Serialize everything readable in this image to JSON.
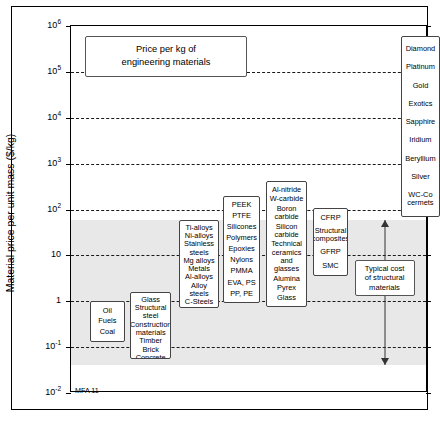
{
  "chart_data": {
    "type": "bar",
    "title_lines": [
      "Price per kg of",
      "engineering materials"
    ],
    "xlabel": "",
    "ylabel": "Material price per unit mass ($/kg)",
    "yscale": "log",
    "ylim": [
      0.01,
      1000000
    ],
    "grid": true,
    "grid_style": "dashed horizontal",
    "credit": "MFA 11",
    "yticks": [
      {
        "value": 0.01,
        "label": "10",
        "exp": "-2"
      },
      {
        "value": 0.1,
        "label": "10",
        "exp": "-1"
      },
      {
        "value": 1,
        "label": "1",
        "exp": ""
      },
      {
        "value": 10,
        "label": "10",
        "exp": ""
      },
      {
        "value": 100,
        "label": "10",
        "exp": "2"
      },
      {
        "value": 1000,
        "label": "10",
        "exp": "3"
      },
      {
        "value": 10000,
        "label": "10",
        "exp": "4"
      },
      {
        "value": 100000,
        "label": "10",
        "exp": "5"
      },
      {
        "value": 1000000,
        "label": "10",
        "exp": "6"
      }
    ],
    "gridlines": [
      0.1,
      1,
      10,
      100,
      1000,
      10000,
      100000
    ],
    "shaded_band": {
      "label": "Typical cost of structural materials",
      "ymin": 0.04,
      "ymax": 60,
      "color": "#e8e8e8"
    },
    "annotation": {
      "label_lines": [
        "Typical cost",
        "of structural",
        "materials"
      ],
      "arrow": "double-headed vertical",
      "ymin": 0.04,
      "ymax": 60
    },
    "series": [
      {
        "name": "Fuels",
        "ymin": 0.13,
        "ymax": 1.0,
        "items": [
          "Oil",
          "Fuels",
          "Coal"
        ]
      },
      {
        "name": "Construction materials",
        "ymin": 0.055,
        "ymax": 1.6,
        "items": [
          "Glass",
          "Structural steel",
          "Construction materials",
          "Timber",
          "Brick",
          "Concrete"
        ]
      },
      {
        "name": "Metals",
        "ymin": 0.7,
        "ymax": 60,
        "items": [
          "Ti-alloys",
          "Ni-alloys",
          "Stainless steels",
          "Mg alloys",
          "Metals",
          "Al-alloys",
          "Alloy steels",
          "C-Steels",
          "Cast irons"
        ]
      },
      {
        "name": "Polymers",
        "ymin": 0.9,
        "ymax": 200,
        "items": [
          "PEEK",
          "PTFE",
          "Silicones",
          "Polymers",
          "Epoxies",
          "Nylons",
          "PMMA",
          "EVA,  PS",
          "PP,  PE"
        ]
      },
      {
        "name": "Technical ceramics and glasses",
        "ymin": 0.75,
        "ymax": 420,
        "items": [
          "Al-nitride",
          "W-carbide",
          "Boron carbide",
          "Silicon carbide",
          "Technical ceramics and glasses",
          "Alumina",
          "Pyrex",
          "Glass"
        ]
      },
      {
        "name": "Structural composites",
        "ymin": 3.5,
        "ymax": 110,
        "items": [
          "CFRP",
          "Structural composites",
          "GFRP",
          "SMC"
        ]
      },
      {
        "name": "Precious materials",
        "ymin": 70,
        "ymax": 600000,
        "items": [
          "Diamond",
          "Platinum",
          "Gold",
          "Exotics",
          "Sapphire",
          "Iridium",
          "Beryllium",
          "Silver",
          "WC-Co cermets"
        ]
      }
    ]
  }
}
